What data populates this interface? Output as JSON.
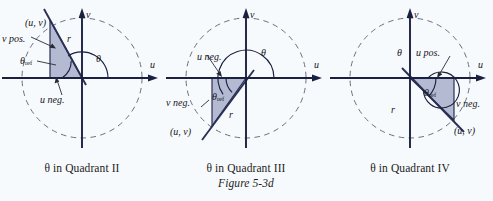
{
  "figure": {
    "number_label": "Figure 5-3d",
    "colors": {
      "background": "#f7fafc",
      "axis": "#1b2040",
      "circle_dashed": "#6e6e78",
      "triangle_fill": "#b0b6d0",
      "triangle_stroke": "#2a3055",
      "text": "#15151c",
      "leader": "#2a2a35"
    },
    "panels": [
      {
        "id": "quadrant-2",
        "caption": "θ in Quadrant II",
        "quadrant": "II",
        "theta_degrees": 122,
        "axis_labels": {
          "x": "u",
          "y": "v"
        },
        "labels": {
          "point": "(u, v)",
          "radius": "r",
          "theta": "θ",
          "theta_ref_base": "θ",
          "theta_ref_sub": "ref",
          "sign_v": "v pos.",
          "sign_u": "u neg."
        }
      },
      {
        "id": "quadrant-3",
        "caption": "θ in Quadrant III",
        "quadrant": "III",
        "theta_degrees": 215,
        "axis_labels": {
          "x": "u",
          "y": "v"
        },
        "labels": {
          "point": "(u, v)",
          "radius": "r",
          "theta": "θ",
          "theta_ref_base": "θ",
          "theta_ref_sub": "ref",
          "sign_v": "v neg.",
          "sign_u": "u neg."
        }
      },
      {
        "id": "quadrant-4",
        "caption": "θ in Quadrant IV",
        "quadrant": "IV",
        "theta_degrees": 318,
        "axis_labels": {
          "x": "u",
          "y": "v"
        },
        "labels": {
          "point": "(u, v)",
          "radius": "r",
          "theta": "θ",
          "theta_ref_base": "θ",
          "theta_ref_sub": "ref",
          "sign_v": "v neg.",
          "sign_u": "u pos."
        }
      }
    ]
  }
}
